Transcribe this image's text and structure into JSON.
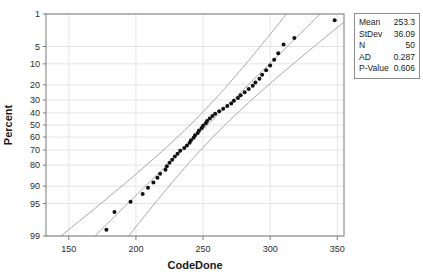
{
  "chart_data": {
    "type": "scatter",
    "subtype": "normal-probability-plot",
    "title": "",
    "xlabel": "CodeDone",
    "ylabel": "Percent",
    "xlim": [
      133,
      355
    ],
    "xticks": [
      150,
      200,
      250,
      300,
      350
    ],
    "ylabel_scale": "normal-probability",
    "yticks": [
      1,
      5,
      10,
      20,
      30,
      40,
      50,
      60,
      70,
      80,
      90,
      95,
      99
    ],
    "ylim": [
      0.7,
      99.3
    ],
    "grid": true,
    "legend": "none",
    "point_color": "#111111",
    "line_color": "#9a9a9a",
    "frame_color": "#7a7a7a",
    "grid_color": "#e4e4e4",
    "fit_line": {
      "mean": 253.3,
      "stdev": 36.09,
      "description": "Normal distribution fit line through mean with slope of StDev"
    },
    "confidence_bands": {
      "level": 95,
      "description": "95% confidence interval curves on either side of the fitted line"
    },
    "points": [
      {
        "x": 178,
        "p": 1.4
      },
      {
        "x": 184,
        "p": 3.4
      },
      {
        "x": 196,
        "p": 5.4
      },
      {
        "x": 205,
        "p": 7.4
      },
      {
        "x": 209,
        "p": 9.4
      },
      {
        "x": 213,
        "p": 11.4
      },
      {
        "x": 216,
        "p": 13.4
      },
      {
        "x": 218,
        "p": 15.4
      },
      {
        "x": 222,
        "p": 17.4
      },
      {
        "x": 223,
        "p": 19.4
      },
      {
        "x": 225,
        "p": 21.4
      },
      {
        "x": 227,
        "p": 23.4
      },
      {
        "x": 229,
        "p": 25.4
      },
      {
        "x": 231,
        "p": 27.4
      },
      {
        "x": 233,
        "p": 29.4
      },
      {
        "x": 236,
        "p": 31.4
      },
      {
        "x": 238,
        "p": 33.4
      },
      {
        "x": 240,
        "p": 35.4
      },
      {
        "x": 241,
        "p": 37.4
      },
      {
        "x": 243,
        "p": 39.4
      },
      {
        "x": 244,
        "p": 41.4
      },
      {
        "x": 246,
        "p": 43.4
      },
      {
        "x": 247,
        "p": 45.4
      },
      {
        "x": 249,
        "p": 47.4
      },
      {
        "x": 250,
        "p": 49.4
      },
      {
        "x": 252,
        "p": 51.4
      },
      {
        "x": 253,
        "p": 53.4
      },
      {
        "x": 255,
        "p": 55.4
      },
      {
        "x": 257,
        "p": 57.4
      },
      {
        "x": 259,
        "p": 59.4
      },
      {
        "x": 262,
        "p": 61.4
      },
      {
        "x": 265,
        "p": 63.4
      },
      {
        "x": 268,
        "p": 65.4
      },
      {
        "x": 271,
        "p": 67.4
      },
      {
        "x": 273,
        "p": 69.4
      },
      {
        "x": 276,
        "p": 71.4
      },
      {
        "x": 278,
        "p": 73.4
      },
      {
        "x": 281,
        "p": 75.4
      },
      {
        "x": 284,
        "p": 77.4
      },
      {
        "x": 287,
        "p": 79.4
      },
      {
        "x": 289,
        "p": 81.4
      },
      {
        "x": 292,
        "p": 83.4
      },
      {
        "x": 294,
        "p": 85.4
      },
      {
        "x": 297,
        "p": 87.4
      },
      {
        "x": 300,
        "p": 89.4
      },
      {
        "x": 303,
        "p": 91.4
      },
      {
        "x": 306,
        "p": 93.4
      },
      {
        "x": 310,
        "p": 95.4
      },
      {
        "x": 318,
        "p": 96.6
      },
      {
        "x": 348,
        "p": 98.6
      }
    ]
  },
  "axes": {
    "x": {
      "title": "CodeDone",
      "tick_labels": [
        "150",
        "200",
        "250",
        "300",
        "350"
      ]
    },
    "y": {
      "title": "Percent",
      "tick_labels": [
        "99",
        "95",
        "90",
        "80",
        "70",
        "60",
        "50",
        "40",
        "30",
        "20",
        "10",
        "5",
        "1"
      ]
    }
  },
  "stats_box": {
    "rows": [
      {
        "label": "Mean",
        "value": "253.3"
      },
      {
        "label": "StDev",
        "value": "36.09"
      },
      {
        "label": "N",
        "value": "50"
      },
      {
        "label": "AD",
        "value": "0.287"
      },
      {
        "label": "P-Value",
        "value": "0.606"
      }
    ]
  }
}
